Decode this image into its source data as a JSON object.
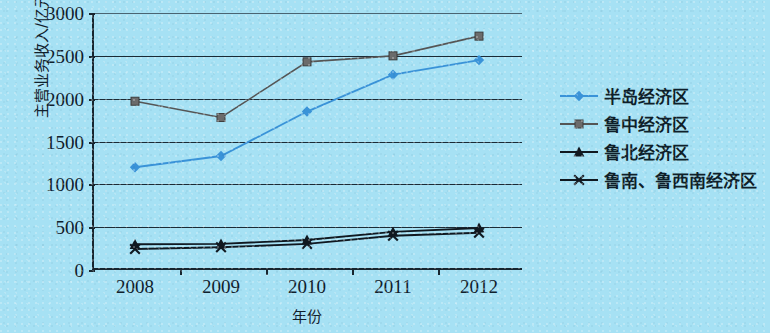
{
  "chart_data": {
    "type": "line",
    "title": "",
    "xlabel": "年份",
    "ylabel": "主营业务收入/亿元",
    "categories": [
      "2008",
      "2009",
      "2010",
      "2011",
      "2012"
    ],
    "ylim": [
      0,
      3000
    ],
    "ytick_labels": [
      "0",
      "500",
      "1000",
      "1500",
      "2000",
      "2500",
      "3000"
    ],
    "yticks": [
      0,
      500,
      1000,
      1500,
      2000,
      2500,
      3000
    ],
    "grid": true,
    "legend_position": "right",
    "series": [
      {
        "name": "半岛经济区",
        "marker": "diamond",
        "color": "#3a93d8",
        "values": [
          1200,
          1330,
          1850,
          2280,
          2450
        ]
      },
      {
        "name": "鲁中经济区",
        "marker": "square",
        "color": "#6b6b6b",
        "line_color": "#555555",
        "values": [
          1970,
          1780,
          2430,
          2500,
          2730
        ]
      },
      {
        "name": "鲁北经济区",
        "marker": "triangle",
        "color": "#101820",
        "values": [
          300,
          305,
          350,
          445,
          490
        ]
      },
      {
        "name": "鲁南、鲁西南经济区",
        "marker": "x",
        "color": "#101820",
        "values": [
          245,
          265,
          305,
          400,
          435
        ]
      }
    ]
  },
  "colors": {
    "background": "#a6e1f4",
    "axis": "#17252f",
    "text": "#10202c",
    "series_peninsula": "#3a93d8",
    "series_luzhong": "#6b6b6b",
    "series_lubei": "#101820",
    "series_lunan": "#101820"
  }
}
